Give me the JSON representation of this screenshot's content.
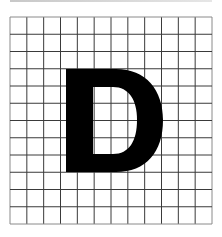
{
  "figure": {
    "letter": "D",
    "grid": {
      "columns": 12,
      "rows": 12,
      "line_color": "#3a3a3a",
      "border_color": "#8a8a8a"
    },
    "colors": {
      "background": "#ffffff",
      "letter": "#000000"
    }
  }
}
